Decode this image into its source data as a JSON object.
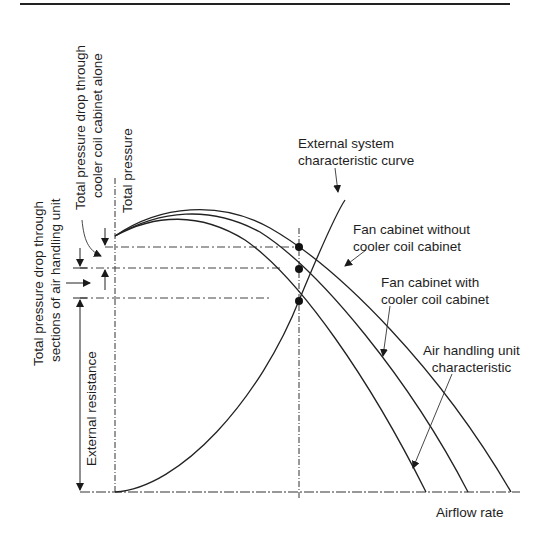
{
  "diagram": {
    "title": "",
    "curves": {
      "external_system": "External system characteristic curve",
      "fan_without_coil": "Fan cabinet without cooler coil cabinet",
      "fan_with_coil": "Fan cabinet with cooler coil cabinet",
      "ahu": "Air handling unit characteristic"
    },
    "labels": {
      "external_system_line1": "External system",
      "external_system_line2": "characteristic curve",
      "fan_without_line1": "Fan cabinet without",
      "fan_without_line2": "cooler coil cabinet",
      "fan_with_line1": "Fan cabinet with",
      "fan_with_line2": "cooler coil cabinet",
      "ahu_line1": "Air handling unit",
      "ahu_line2": "characteristic",
      "x_axis": "Airflow rate",
      "y_axis": "Total pressure",
      "coil_drop_line1": "Total pressure drop through",
      "coil_drop_line2": "cooler coil cabinet alone",
      "ahu_drop_line1": "Total pressure drop through",
      "ahu_drop_line2": "sections of air handling unit",
      "external_resistance": "External resistance"
    },
    "operating_points": 3
  }
}
